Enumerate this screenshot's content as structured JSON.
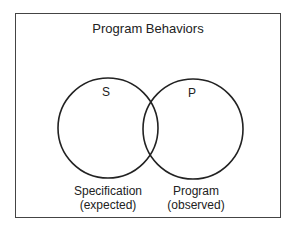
{
  "diagram": {
    "title": "Program Behaviors",
    "sets": [
      {
        "id": "S",
        "label": "S",
        "caption_line1": "Specification",
        "caption_line2": "(expected)"
      },
      {
        "id": "P",
        "label": "P",
        "caption_line1": "Program",
        "caption_line2": "(observed)"
      }
    ],
    "colors": {
      "stroke": "#222222",
      "frame": "#444444",
      "background": "#ffffff"
    }
  }
}
